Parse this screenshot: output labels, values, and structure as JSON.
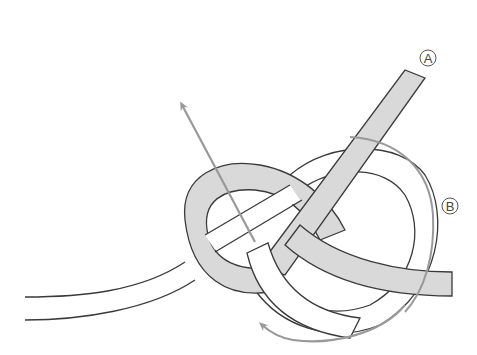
{
  "diagram": {
    "type": "knot-tying-illustration",
    "labels": {
      "a": "A",
      "b": "B"
    },
    "colors": {
      "rope_shaded_fill": "#d9d9d9",
      "rope_white_fill": "#ffffff",
      "rope_outline": "#3a3a3a",
      "arrow": "#999999",
      "label_outline": "#555555"
    },
    "arrows": [
      {
        "name": "pull-up-arrow",
        "direction": "up-left"
      },
      {
        "name": "wrap-arrow-b",
        "direction": "clockwise-down"
      },
      {
        "name": "bottom-loop-arrow",
        "direction": "left"
      }
    ]
  }
}
